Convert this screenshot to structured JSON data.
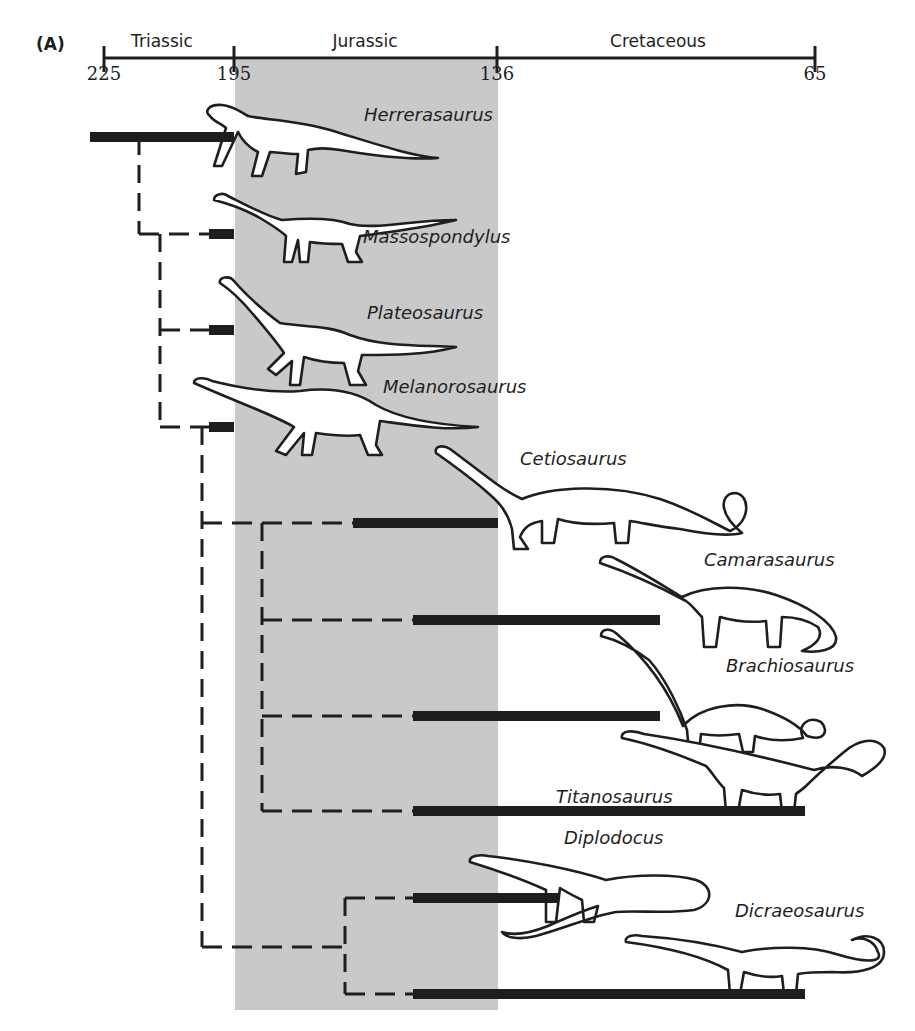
{
  "figure": {
    "panel_label": "(A)",
    "colors": {
      "ink": "#1e1e1e",
      "jurassic_band": "#c9c9c9",
      "background": "#ffffff",
      "dinosaur_fill": "#ffffff"
    }
  },
  "timescale": {
    "unit": "million years ago",
    "ticks": [
      {
        "value": "225",
        "x": 104
      },
      {
        "value": "195",
        "x": 234
      },
      {
        "value": "136",
        "x": 497
      },
      {
        "value": "65",
        "x": 815
      }
    ],
    "periods": [
      {
        "name": "Triassic",
        "start": 225,
        "end": 195,
        "center_x": 162
      },
      {
        "name": "Jurassic",
        "start": 195,
        "end": 136,
        "center_x": 365
      },
      {
        "name": "Cretaceous",
        "start": 136,
        "end": 65,
        "center_x": 658
      }
    ],
    "highlighted_period": "Jurassic"
  },
  "taxa": [
    {
      "name": "Herrerasaurus",
      "bar_y": 137,
      "bar_x1": 90,
      "bar_x2": 234,
      "label_x": 364,
      "label_y": 104,
      "dino": {
        "type": "theropod",
        "x": 200,
        "y": 102,
        "scale": 1.0
      }
    },
    {
      "name": "Massospondylus",
      "bar_y": 234,
      "bar_x1": 209,
      "bar_x2": 234,
      "label_x": 363,
      "label_y": 226,
      "dino": {
        "type": "prosauropod",
        "x": 210,
        "y": 190,
        "scale": 1.0
      }
    },
    {
      "name": "Plateosaurus",
      "bar_y": 330,
      "bar_x1": 209,
      "bar_x2": 234,
      "label_x": 367,
      "label_y": 302,
      "dino": {
        "type": "prosauropod_tall",
        "x": 212,
        "y": 275,
        "scale": 1.0
      }
    },
    {
      "name": "Melanorosaurus",
      "bar_y": 427,
      "bar_x1": 209,
      "bar_x2": 234,
      "label_x": 383,
      "label_y": 376,
      "dino": {
        "type": "sauropod_early",
        "x": 190,
        "y": 375,
        "scale": 1.0
      }
    },
    {
      "name": "Cetiosaurus",
      "bar_y": 523,
      "bar_x1": 353,
      "bar_x2": 498,
      "label_x": 520,
      "label_y": 448,
      "dino": {
        "type": "sauropod_loop",
        "x": 430,
        "y": 443,
        "scale": 1.0
      }
    },
    {
      "name": "Camarasaurus",
      "bar_y": 620,
      "bar_x1": 413,
      "bar_x2": 660,
      "label_x": 704,
      "label_y": 549,
      "dino": {
        "type": "sauropod",
        "x": 596,
        "y": 551,
        "scale": 1.0
      }
    },
    {
      "name": "Brachiosaurus",
      "bar_y": 716,
      "bar_x1": 413,
      "bar_x2": 660,
      "label_x": 726,
      "label_y": 655,
      "dino": {
        "type": "brachiosaur",
        "x": 597,
        "y": 626,
        "scale": 1.0
      }
    },
    {
      "name": "Titanosaurus",
      "bar_y": 811,
      "bar_x1": 413,
      "bar_x2": 805,
      "label_x": 556,
      "label_y": 786,
      "dino": {
        "type": "titanosaur",
        "x": 618,
        "y": 728,
        "scale": 1.0
      }
    },
    {
      "name": "Diplodocus",
      "bar_y": 898,
      "bar_x1": 413,
      "bar_x2": 558,
      "label_x": 564,
      "label_y": 827,
      "dino": {
        "type": "diplodocid",
        "x": 466,
        "y": 850,
        "scale": 1.0
      }
    },
    {
      "name": "Dicraeosaurus",
      "bar_y": 994,
      "bar_x1": 413,
      "bar_x2": 805,
      "label_x": 735,
      "label_y": 900,
      "dino": {
        "type": "dicraeosaur",
        "x": 622,
        "y": 922,
        "scale": 1.0
      }
    }
  ],
  "tree": {
    "nodes": [
      {
        "id": "n1",
        "x": 139,
        "y_top": 137,
        "y_bottom": 234
      },
      {
        "id": "n2",
        "x": 160,
        "y_top": 234,
        "y_bottom": 427
      },
      {
        "id": "n3",
        "x": 202,
        "y_top": 427,
        "y_bottom": 947
      },
      {
        "id": "n4",
        "x": 262,
        "y_top": 523,
        "y_bottom": 811
      },
      {
        "id": "n5",
        "x": 345,
        "y_top": 898,
        "y_bottom": 994
      }
    ],
    "dashed_links": [
      {
        "from_x": 139,
        "to_x": 209,
        "y": 234,
        "comment": "n1 -> n2"
      },
      {
        "from_x": 160,
        "to_x": 209,
        "y": 330
      },
      {
        "from_x": 160,
        "to_x": 209,
        "y": 427
      },
      {
        "from_x": 202,
        "to_x": 353,
        "y": 523
      },
      {
        "from_x": 262,
        "to_x": 413,
        "y": 620
      },
      {
        "from_x": 262,
        "to_x": 413,
        "y": 716
      },
      {
        "from_x": 262,
        "to_x": 413,
        "y": 811
      },
      {
        "from_x": 202,
        "to_x": 345,
        "y": 947
      },
      {
        "from_x": 345,
        "to_x": 413,
        "y": 898
      },
      {
        "from_x": 345,
        "to_x": 413,
        "y": 994
      }
    ]
  }
}
